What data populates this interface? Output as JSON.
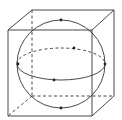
{
  "diagram": {
    "type": "sphere-inscribed-in-cube",
    "colors": {
      "stroke": "#333333",
      "background": "#ffffff"
    },
    "cube": {
      "front_face": {
        "tl": [
          8,
          30
        ],
        "tr": [
          92,
          30
        ],
        "br": [
          92,
          116
        ],
        "bl": [
          8,
          116
        ]
      },
      "back_face": {
        "tl": [
          32,
          10
        ],
        "tr": [
          114,
          10
        ],
        "br": [
          114,
          96
        ],
        "bl": [
          32,
          96
        ]
      }
    },
    "sphere": {
      "cx": 61,
      "cy": 64,
      "r": 44
    },
    "equator": {
      "cx": 61,
      "cy": 64,
      "rx": 44,
      "ry": 16
    },
    "points": [
      {
        "name": "top",
        "x": 61,
        "y": 19
      },
      {
        "name": "bottom",
        "x": 61,
        "y": 109
      },
      {
        "name": "left",
        "x": 18,
        "y": 64
      },
      {
        "name": "right",
        "x": 105,
        "y": 64
      },
      {
        "name": "front",
        "x": 54,
        "y": 81
      },
      {
        "name": "back",
        "x": 74,
        "y": 48
      }
    ]
  }
}
